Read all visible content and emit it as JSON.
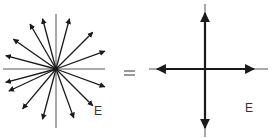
{
  "diagram": {
    "left": {
      "label": "E",
      "center": [
        56,
        69
      ],
      "axes": {
        "h": [
          3,
          105
        ],
        "v": [
          14,
          128
        ]
      },
      "vector_angles_deg": [
        75,
        105,
        120,
        145,
        165,
        45,
        20,
        -20,
        -45,
        -70,
        -105,
        -130,
        -155,
        -165
      ],
      "vector_length": 52
    },
    "equals": "=",
    "right": {
      "label": "E",
      "center": [
        205,
        69
      ],
      "arrows": [
        "up",
        "down",
        "left",
        "right"
      ]
    },
    "colors": {
      "stroke": "#1a1a1a",
      "axis": "#555555"
    }
  }
}
